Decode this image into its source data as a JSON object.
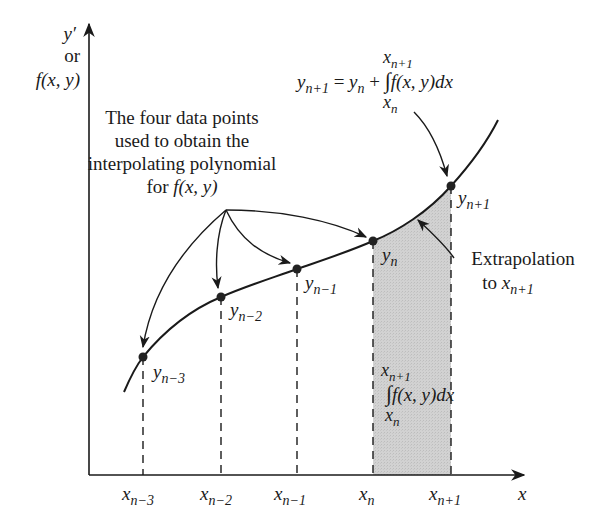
{
  "figure": {
    "colors": {
      "ink": "#1a1a1a",
      "shade": "#cfcfcf",
      "background": "#ffffff"
    },
    "axes": {
      "y_label_line1": "y′",
      "y_label_line2": "or",
      "y_label_line3": "f(x, y)",
      "x_label": "x"
    },
    "x_ticks": [
      {
        "base": "x",
        "sub": "n−3"
      },
      {
        "base": "x",
        "sub": "n−2"
      },
      {
        "base": "x",
        "sub": "n−1"
      },
      {
        "base": "x",
        "sub": "n"
      },
      {
        "base": "x",
        "sub": "n+1"
      }
    ],
    "points": [
      {
        "base": "y",
        "sub": "n−3"
      },
      {
        "base": "y",
        "sub": "n−2"
      },
      {
        "base": "y",
        "sub": "n−1"
      },
      {
        "base": "y",
        "sub": "n"
      },
      {
        "base": "y",
        "sub": "n+1"
      }
    ],
    "annotation_data_points": {
      "line1": "The four data points",
      "line2": "used to obtain the",
      "line3": "interpolating polynomial",
      "line4_prefix": "for ",
      "line4_math": "f(x, y)"
    },
    "annotation_extrapolation": {
      "line1": "Extrapolation",
      "line2_prefix": "to ",
      "line2_base": "x",
      "line2_sub": "n+1"
    },
    "formula_top": {
      "lhs_base": "y",
      "lhs_sub": "n+1",
      "eq": " = ",
      "rhs_base": "y",
      "rhs_sub": "n",
      "plus": " + ",
      "integral": "∫",
      "integrand": "f(x, y)dx",
      "upper_base": "x",
      "upper_sub": "n+1",
      "lower_base": "x",
      "lower_sub": "n"
    },
    "formula_area": {
      "integral": "∫",
      "integrand": "f(x, y)dx",
      "upper_base": "x",
      "upper_sub": "n+1",
      "lower_base": "x",
      "lower_sub": "n"
    }
  }
}
